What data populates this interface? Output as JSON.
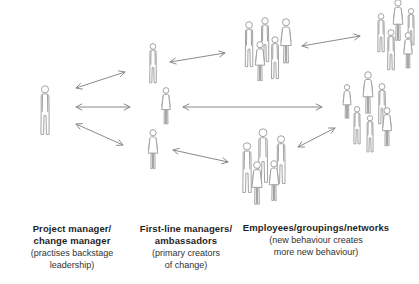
{
  "colors": {
    "background": "#ffffff",
    "figure_stroke": "#a3a3a3",
    "arrow": "#8a8a8a",
    "text_bold": "#1f1f1f",
    "text_normal": "#323232"
  },
  "labels": {
    "project_manager": {
      "bold_lines": [
        "Project manager/",
        "change manager"
      ],
      "normal_lines": [
        "(practises backstage",
        "leadership)"
      ]
    },
    "first_line_managers": {
      "bold_lines": [
        "First-line managers/",
        "ambassadors"
      ],
      "normal_lines": [
        "(primary creators",
        "of change)"
      ]
    },
    "employees": {
      "bold_lines": [
        "Employees/groupings/networks"
      ],
      "normal_lines": [
        "(new behaviour creates",
        "more new behaviour)"
      ]
    }
  },
  "diagram": {
    "clusters": [
      {
        "id": "project-manager-figure",
        "people": [
          {
            "type": "male",
            "cx": 45,
            "top": 85,
            "h": 51
          }
        ]
      },
      {
        "id": "first-line-managers-figures",
        "people": [
          {
            "type": "male",
            "cx": 153,
            "top": 43,
            "h": 41
          },
          {
            "type": "female",
            "cx": 166,
            "top": 87,
            "h": 41
          },
          {
            "type": "female",
            "cx": 153,
            "top": 129,
            "h": 44
          }
        ]
      },
      {
        "id": "employees-group-top",
        "people": [
          {
            "type": "male",
            "cx": 249,
            "top": 21,
            "h": 47
          },
          {
            "type": "male",
            "cx": 265,
            "top": 17,
            "h": 46
          },
          {
            "type": "female",
            "cx": 286,
            "top": 18,
            "h": 50
          },
          {
            "type": "female",
            "cx": 260,
            "top": 41,
            "h": 44
          },
          {
            "type": "male",
            "cx": 275,
            "top": 36,
            "h": 44
          }
        ]
      },
      {
        "id": "employees-group-far-right",
        "people": [
          {
            "type": "male",
            "cx": 381,
            "top": 13,
            "h": 40
          },
          {
            "type": "female",
            "cx": 398,
            "top": -1,
            "h": 46
          },
          {
            "type": "male",
            "cx": 411,
            "top": 8,
            "h": 38
          },
          {
            "type": "male",
            "cx": 391,
            "top": 29,
            "h": 42
          },
          {
            "type": "female",
            "cx": 408,
            "top": 32,
            "h": 40
          }
        ]
      },
      {
        "id": "employees-group-middle-right",
        "people": [
          {
            "type": "female",
            "cx": 347,
            "top": 84,
            "h": 38
          },
          {
            "type": "female",
            "cx": 368,
            "top": 71,
            "h": 47
          },
          {
            "type": "male",
            "cx": 382,
            "top": 83,
            "h": 42
          },
          {
            "type": "male",
            "cx": 357,
            "top": 106,
            "h": 39
          },
          {
            "type": "male",
            "cx": 370,
            "top": 115,
            "h": 38
          },
          {
            "type": "female",
            "cx": 387,
            "top": 107,
            "h": 43
          }
        ]
      },
      {
        "id": "employees-group-bottom-centre",
        "people": [
          {
            "type": "male",
            "cx": 247,
            "top": 142,
            "h": 52
          },
          {
            "type": "male",
            "cx": 263,
            "top": 128,
            "h": 56
          },
          {
            "type": "male",
            "cx": 281,
            "top": 135,
            "h": 50
          },
          {
            "type": "female",
            "cx": 257,
            "top": 161,
            "h": 48
          },
          {
            "type": "female",
            "cx": 274,
            "top": 160,
            "h": 45
          }
        ]
      }
    ],
    "arrows": [
      {
        "id": "pm-to-flm-top",
        "x1": 76,
        "y1": 88,
        "x2": 125,
        "y2": 72
      },
      {
        "id": "pm-to-flm-middle",
        "x1": 76,
        "y1": 107,
        "x2": 130,
        "y2": 107
      },
      {
        "id": "pm-to-flm-bottom",
        "x1": 76,
        "y1": 124,
        "x2": 123,
        "y2": 145
      },
      {
        "id": "flm-top-to-group-top",
        "x1": 170,
        "y1": 62,
        "x2": 225,
        "y2": 53
      },
      {
        "id": "flm-middle-to-group-middle",
        "x1": 183,
        "y1": 107,
        "x2": 322,
        "y2": 107
      },
      {
        "id": "flm-bottom-to-group-bottom",
        "x1": 173,
        "y1": 150,
        "x2": 228,
        "y2": 162
      },
      {
        "id": "group-top-to-group-far-right",
        "x1": 302,
        "y1": 46,
        "x2": 360,
        "y2": 36
      },
      {
        "id": "group-bottom-to-group-middle",
        "x1": 298,
        "y1": 147,
        "x2": 335,
        "y2": 128
      }
    ]
  }
}
